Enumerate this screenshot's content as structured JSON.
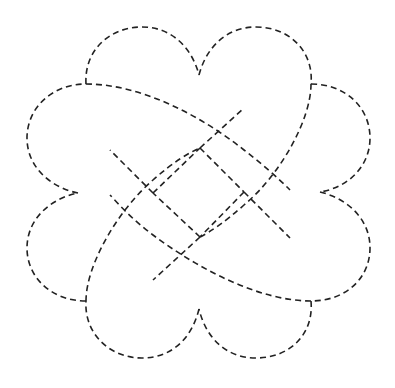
{
  "figure": {
    "stroke_color": "#222222",
    "background_color": "#ffffff",
    "line_style": "dashed",
    "center": [
      199,
      192
    ],
    "notches": {
      "top": [
        199,
        75
      ],
      "right": [
        320,
        192
      ],
      "bottom": [
        199,
        309
      ],
      "left": [
        78,
        193
      ]
    },
    "junctions": [
      [
        86,
        84
      ],
      [
        311,
        84
      ],
      [
        311,
        301
      ],
      [
        86,
        301
      ]
    ],
    "inner_square": [
      [
        200,
        148
      ],
      [
        244,
        192
      ],
      [
        200,
        237
      ],
      [
        153,
        193
      ]
    ]
  }
}
